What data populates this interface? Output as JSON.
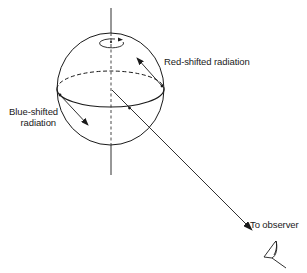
{
  "diagram": {
    "colors": {
      "stroke": "#1a1a1a",
      "background": "#ffffff"
    },
    "labels": {
      "red_shifted": "Red-shifted radiation",
      "blue_shifted_line1": "Blue-shifted",
      "blue_shifted_line2": "radiation",
      "to_observer": "To observer"
    },
    "elements": [
      {
        "id": "sphere",
        "type": "circle",
        "description": "Rotating star"
      },
      {
        "id": "equator",
        "type": "ellipse",
        "description": "Equator (front solid, back dashed)"
      },
      {
        "id": "rotation-axis",
        "type": "line",
        "description": "Rotation axis (dashed inside sphere)"
      },
      {
        "id": "rotation-indicator",
        "type": "arrow-loop",
        "description": "Rotation direction near pole"
      },
      {
        "id": "red-shift-arrow",
        "type": "arrow",
        "description": "Radiation receding from observer"
      },
      {
        "id": "blue-shift-arrow",
        "type": "arrow",
        "description": "Radiation approaching observer"
      },
      {
        "id": "observer-line",
        "type": "arrow",
        "description": "Line of sight to observer"
      },
      {
        "id": "observer-eye",
        "type": "icon",
        "description": "Observer eye"
      }
    ]
  }
}
